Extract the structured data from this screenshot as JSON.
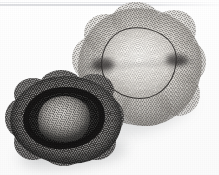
{
  "image": {
    "kind": "photograph",
    "subject": "two mesh hair nets / disposable hair caps on a plain white surface",
    "width_px": 219,
    "height_px": 175,
    "background_color": "#fcfcfc",
    "has_visible_text": false,
    "caption": ""
  },
  "artifacts": {
    "scan_line": {
      "name": "faint horizontal scan edge near top",
      "color": "#d6d7db",
      "position": "top, approximately y = 4 px"
    }
  },
  "objects": [
    {
      "id": "hair-net-light",
      "label": "light beige mesh hair net",
      "position": "upper right",
      "mesh_color": "#cfcbc4",
      "highlight_color": "#f6f4f0",
      "shadow_color": "#8f8c86",
      "elastic_band": {
        "label": "dark elastic band ring",
        "color": "#222021",
        "shape": "irregular rounded oval",
        "pinch_points": 2
      },
      "ruffle_lobes": 8,
      "orientation": "opening facing the camera, fabric gathered outward"
    },
    {
      "id": "hair-net-dark",
      "label": "dark charcoal mesh hair net",
      "position": "lower left",
      "mesh_color": "#2c2a29",
      "rim_color": "#100f0f",
      "inner_dome_color": "#b0aca7",
      "ruffle_lobes": 8,
      "orientation": "tilted, rolled rim visible with lighter mesh dome inside"
    }
  ],
  "shadows": [
    {
      "id": "shadow-light-net",
      "color": "rgba(120,122,126,0.22)"
    },
    {
      "id": "shadow-dark-net",
      "color": "rgba(95,97,101,0.28)"
    }
  ],
  "palette": {
    "background": "#fcfcfc",
    "paper_white": "#ffffff",
    "light_net_mid": "#cfcbc4",
    "dark_net_mid": "#2c2a29",
    "elastic_black": "#222021",
    "inner_dome_gray": "#b0aca7",
    "scan_line_gray": "#d6d7db"
  }
}
